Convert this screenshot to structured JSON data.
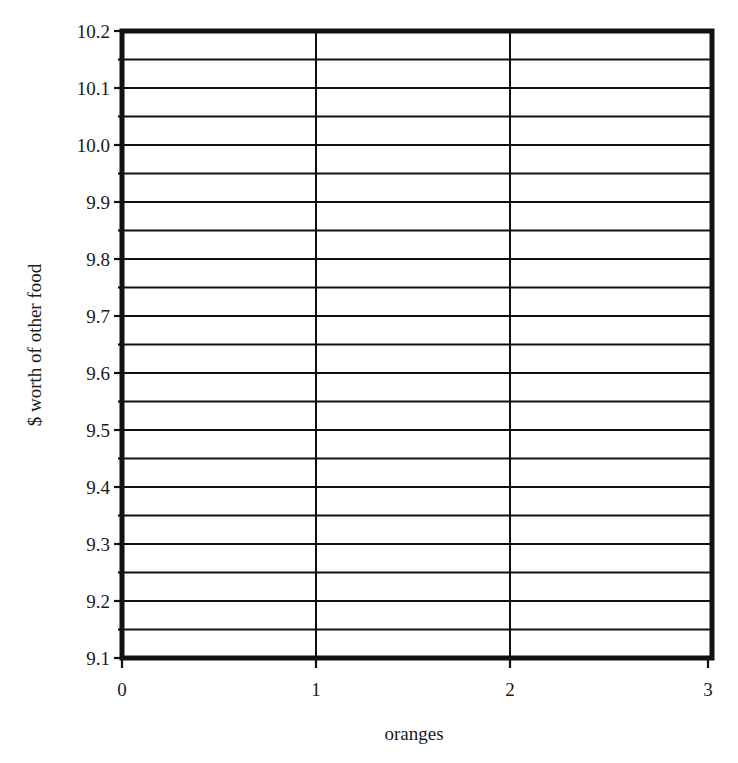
{
  "chart_data": {
    "type": "line",
    "title": "",
    "xlabel": "oranges",
    "ylabel": "$ worth of other food",
    "xlim": [
      0,
      3
    ],
    "ylim": [
      9.1,
      10.2
    ],
    "x_ticks": [
      "0",
      "1",
      "2",
      "3"
    ],
    "y_ticks": [
      "9.1",
      "9.2",
      "9.3",
      "9.4",
      "9.5",
      "9.6",
      "9.7",
      "9.8",
      "9.9",
      "10.0",
      "10.1",
      "10.2"
    ],
    "y_minor_step": 0.05,
    "grid": {
      "horizontal": true,
      "vertical": true,
      "vertical_at": [
        1,
        2
      ]
    },
    "series": [],
    "legend": null
  },
  "colors": {
    "background": "#ffffff",
    "ink": "#111111"
  }
}
